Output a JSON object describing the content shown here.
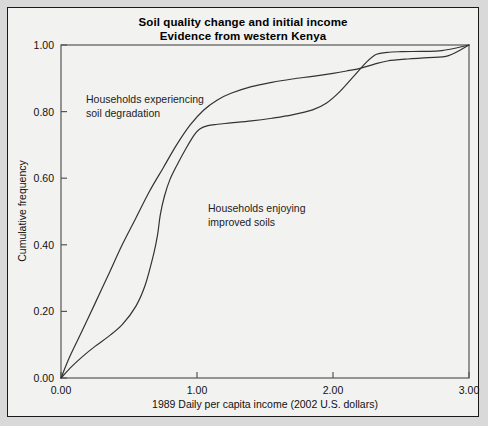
{
  "figure": {
    "title_line1": "Soil quality change and initial income",
    "title_line2": "Evidence from western Kenya",
    "background": "#f2f2f0",
    "border_color": "#1a1a1a",
    "page_background": "#d9d9d9"
  },
  "chart_data": {
    "type": "line",
    "title": "Soil quality change and initial income\nEvidence from western Kenya",
    "xlabel": "1989 Daily per capita income (2002 U.S. dollars)",
    "ylabel": "Cumulative frequency",
    "xlim": [
      0,
      3
    ],
    "ylim": [
      0,
      1
    ],
    "xticks": [
      0,
      1,
      2,
      3
    ],
    "xtick_labels": [
      "0.00",
      "1.00",
      "2.00",
      "3.00"
    ],
    "yticks": [
      0,
      0.2,
      0.4,
      0.6,
      0.8,
      1
    ],
    "ytick_labels": [
      "0.00",
      "0.20",
      "0.40",
      "0.60",
      "0.80",
      "1.00"
    ],
    "grid": false,
    "legend": "annotations",
    "line_color": "#333333",
    "series": [
      {
        "name": "Households experiencing soil degradation",
        "annotation_line1": "Households experiencing",
        "annotation_line2": "soil degradation",
        "x": [
          0.0,
          0.06,
          0.13,
          0.2,
          0.28,
          0.36,
          0.45,
          0.55,
          0.65,
          0.75,
          0.85,
          0.95,
          1.05,
          1.15,
          1.25,
          1.4,
          1.55,
          1.7,
          1.85,
          2.0,
          2.1,
          2.2,
          2.3,
          2.4,
          2.55,
          2.7,
          2.85,
          3.0
        ],
        "y": [
          0.0,
          0.06,
          0.12,
          0.18,
          0.25,
          0.32,
          0.4,
          0.48,
          0.56,
          0.63,
          0.7,
          0.76,
          0.805,
          0.835,
          0.855,
          0.875,
          0.888,
          0.898,
          0.906,
          0.915,
          0.922,
          0.93,
          0.942,
          0.952,
          0.958,
          0.962,
          0.968,
          1.0
        ]
      },
      {
        "name": "Households enjoying improved soils",
        "annotation_line1": "Households enjoying",
        "annotation_line2": "improved soils",
        "x": [
          0.0,
          0.08,
          0.16,
          0.25,
          0.35,
          0.45,
          0.55,
          0.62,
          0.68,
          0.71,
          0.73,
          0.76,
          0.8,
          0.86,
          0.92,
          0.98,
          1.02,
          1.08,
          1.15,
          1.25,
          1.4,
          1.55,
          1.7,
          1.85,
          1.95,
          2.05,
          2.15,
          2.25,
          2.32,
          2.4,
          2.5,
          2.65,
          2.8,
          3.0
        ],
        "y": [
          0.0,
          0.035,
          0.065,
          0.095,
          0.125,
          0.16,
          0.215,
          0.28,
          0.37,
          0.43,
          0.49,
          0.545,
          0.595,
          0.645,
          0.69,
          0.73,
          0.748,
          0.758,
          0.762,
          0.766,
          0.772,
          0.78,
          0.79,
          0.805,
          0.825,
          0.86,
          0.905,
          0.95,
          0.972,
          0.978,
          0.98,
          0.981,
          0.983,
          1.0
        ]
      }
    ]
  }
}
